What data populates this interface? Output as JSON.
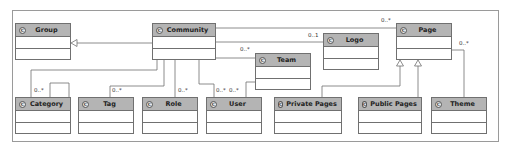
{
  "diagram": {
    "type": "UML class diagram",
    "classes": [
      {
        "id": "group",
        "name": "Group",
        "stereotype_icon": "C"
      },
      {
        "id": "community",
        "name": "Community",
        "stereotype_icon": "C"
      },
      {
        "id": "team",
        "name": "Team",
        "stereotype_icon": "C"
      },
      {
        "id": "logo",
        "name": "Logo",
        "stereotype_icon": "C"
      },
      {
        "id": "page",
        "name": "Page",
        "stereotype_icon": "C"
      },
      {
        "id": "category",
        "name": "Category",
        "stereotype_icon": "C"
      },
      {
        "id": "tag",
        "name": "Tag",
        "stereotype_icon": "C"
      },
      {
        "id": "role",
        "name": "Role",
        "stereotype_icon": "C"
      },
      {
        "id": "user",
        "name": "User",
        "stereotype_icon": "C"
      },
      {
        "id": "private_pages",
        "name": "Private Pages",
        "stereotype_icon": "C"
      },
      {
        "id": "public_pages",
        "name": "Public Pages",
        "stereotype_icon": "C"
      },
      {
        "id": "theme",
        "name": "Theme",
        "stereotype_icon": "C"
      }
    ],
    "relations": [
      {
        "from": "Community",
        "to": "Group",
        "kind": "generalization"
      },
      {
        "from": "Community",
        "to": "Page",
        "kind": "association",
        "multiplicity": "0..*"
      },
      {
        "from": "Community",
        "to": "Logo",
        "kind": "association",
        "multiplicity": "0..1"
      },
      {
        "from": "Community",
        "to": "Team",
        "kind": "association",
        "multiplicity": "0..*"
      },
      {
        "from": "Community",
        "to": "Category",
        "kind": "association",
        "multiplicity": "0..*"
      },
      {
        "from": "Community",
        "to": "Tag",
        "kind": "association",
        "multiplicity": "0..*"
      },
      {
        "from": "Community",
        "to": "Role",
        "kind": "association",
        "multiplicity": "0..*"
      },
      {
        "from": "Community",
        "to": "User",
        "kind": "association",
        "multiplicity": "0..*"
      },
      {
        "from": "Team",
        "to": "User",
        "kind": "association",
        "multiplicity": "0..*"
      },
      {
        "from": "Category",
        "to": "Category",
        "kind": "self-association"
      },
      {
        "from": "Private Pages",
        "to": "Page",
        "kind": "generalization"
      },
      {
        "from": "Public Pages",
        "to": "Page",
        "kind": "generalization"
      },
      {
        "from": "Page",
        "to": "Theme",
        "kind": "association",
        "multiplicity": "0..*"
      }
    ],
    "multiplicity_labels": {
      "page": "0..*",
      "logo": "0..1",
      "team": "0..*",
      "category": "0..*",
      "tag": "0..*",
      "role": "0..*",
      "user_community": "0..*",
      "user_team": "0..*",
      "theme": "0..*"
    }
  }
}
